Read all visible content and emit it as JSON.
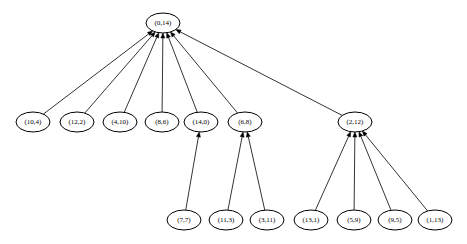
{
  "graph": {
    "type": "tree",
    "direction": "child-to-parent arrows",
    "nodes": [
      {
        "id": "n0",
        "label": "(0,14)",
        "x": 163,
        "y": 23
      },
      {
        "id": "n1",
        "label": "(10,4)",
        "x": 33,
        "y": 122
      },
      {
        "id": "n2",
        "label": "(12,2)",
        "x": 77,
        "y": 122
      },
      {
        "id": "n3",
        "label": "(4,10)",
        "x": 120,
        "y": 122
      },
      {
        "id": "n4",
        "label": "(8,6)",
        "x": 162,
        "y": 122
      },
      {
        "id": "n5",
        "label": "(14,0)",
        "x": 201,
        "y": 122
      },
      {
        "id": "n6",
        "label": "(6,8)",
        "x": 245,
        "y": 122
      },
      {
        "id": "n7",
        "label": "(2,12)",
        "x": 355,
        "y": 122
      },
      {
        "id": "n8",
        "label": "(7,7)",
        "x": 184,
        "y": 220
      },
      {
        "id": "n9",
        "label": "(11,3)",
        "x": 226,
        "y": 220
      },
      {
        "id": "n10",
        "label": "(3,11)",
        "x": 267,
        "y": 220
      },
      {
        "id": "n11",
        "label": "(13,1)",
        "x": 311,
        "y": 220
      },
      {
        "id": "n12",
        "label": "(5,9)",
        "x": 354,
        "y": 220
      },
      {
        "id": "n13",
        "label": "(9,5)",
        "x": 395,
        "y": 220
      },
      {
        "id": "n14",
        "label": "(1,13)",
        "x": 435,
        "y": 220
      }
    ],
    "edges": [
      {
        "from": "n1",
        "to": "n0"
      },
      {
        "from": "n2",
        "to": "n0"
      },
      {
        "from": "n3",
        "to": "n0"
      },
      {
        "from": "n4",
        "to": "n0"
      },
      {
        "from": "n5",
        "to": "n0"
      },
      {
        "from": "n6",
        "to": "n0"
      },
      {
        "from": "n7",
        "to": "n0"
      },
      {
        "from": "n8",
        "to": "n5"
      },
      {
        "from": "n9",
        "to": "n6"
      },
      {
        "from": "n10",
        "to": "n6"
      },
      {
        "from": "n11",
        "to": "n7"
      },
      {
        "from": "n12",
        "to": "n7"
      },
      {
        "from": "n13",
        "to": "n7"
      },
      {
        "from": "n14",
        "to": "n7"
      }
    ],
    "style": {
      "node_rx": 17,
      "node_ry": 10,
      "stroke": "#000000",
      "fill": "#ffffff",
      "background": "#ffffff"
    }
  }
}
